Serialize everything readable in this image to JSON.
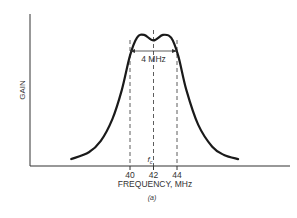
{
  "chart_data": {
    "type": "line",
    "title": "",
    "xlabel": "FREQUENCY, MHz",
    "ylabel": "GAIN",
    "caption": "(a)",
    "x_ticks": [
      40,
      42,
      44
    ],
    "x_tick_labels": [
      "40",
      "42",
      "44"
    ],
    "center_label": "f_c",
    "bandwidth_label": "4 MHz",
    "bandwidth_range": [
      40,
      44
    ],
    "xlim": [
      33,
      51
    ],
    "ylim": [
      0,
      1
    ],
    "series": [
      {
        "name": "gain response",
        "x": [
          35.0,
          36.5,
          37.5,
          38.5,
          39.3,
          40.0,
          40.6,
          41.2,
          42.0,
          42.8,
          43.5,
          44.1,
          44.8,
          45.8,
          47.0,
          48.0,
          49.2
        ],
        "y": [
          0.05,
          0.1,
          0.18,
          0.34,
          0.55,
          0.8,
          0.93,
          0.95,
          0.91,
          0.95,
          0.93,
          0.8,
          0.55,
          0.3,
          0.14,
          0.08,
          0.05
        ]
      }
    ]
  }
}
